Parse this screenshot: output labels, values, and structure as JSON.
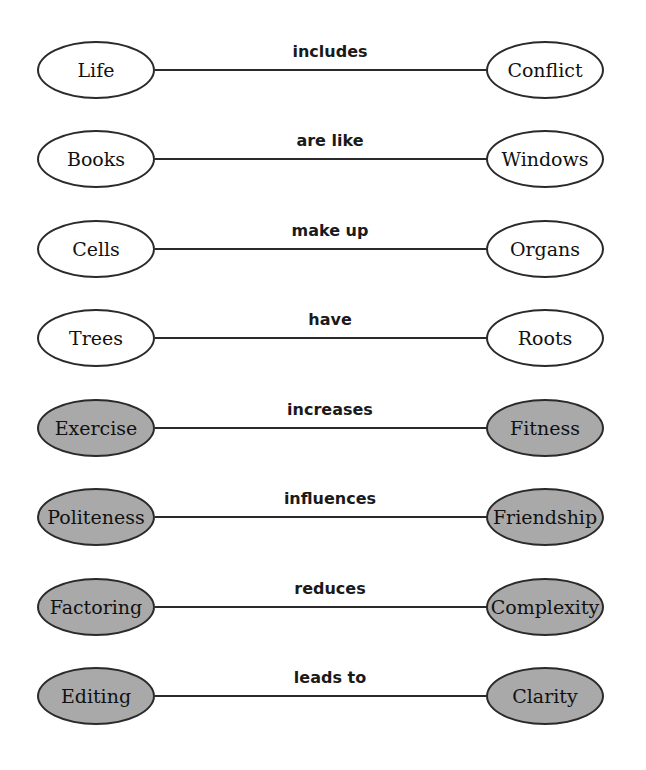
{
  "diagram": {
    "colors": {
      "shaded_fill": "#a9a9a9",
      "outline": "#2a2a2a",
      "plain_fill": "#ffffff"
    },
    "pairs": [
      {
        "left": "Life",
        "relation": "includes",
        "right": "Conflict",
        "shaded": false
      },
      {
        "left": "Books",
        "relation": "are like",
        "right": "Windows",
        "shaded": false
      },
      {
        "left": "Cells",
        "relation": "make up",
        "right": "Organs",
        "shaded": false
      },
      {
        "left": "Trees",
        "relation": "have",
        "right": "Roots",
        "shaded": false
      },
      {
        "left": "Exercise",
        "relation": "increases",
        "right": "Fitness",
        "shaded": true
      },
      {
        "left": "Politeness",
        "relation": "influences",
        "right": "Friendship",
        "shaded": true
      },
      {
        "left": "Factoring",
        "relation": "reduces",
        "right": "Complexity",
        "shaded": true
      },
      {
        "left": "Editing",
        "relation": "leads to",
        "right": "Clarity",
        "shaded": true
      }
    ]
  }
}
